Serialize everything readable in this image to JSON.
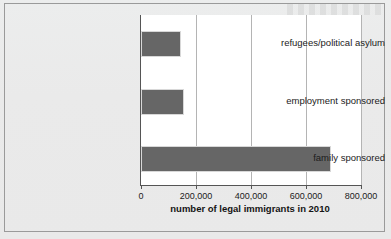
{
  "figure": {
    "background_color": "#eaeaea",
    "plot_background_color": "#ffffff",
    "frame_border_color": "#9a9a9a"
  },
  "chart_data": {
    "type": "bar",
    "orientation": "horizontal",
    "title": "",
    "subtitle": "",
    "xlabel": "number of legal immigrants in 2010",
    "ylabel": "",
    "categories": [
      "family sponsored",
      "employment sponsored",
      "refugees/political asylum"
    ],
    "values": [
      690000,
      155000,
      145000
    ],
    "series": [
      {
        "name": "number of legal immigrants in 2010",
        "values": [
          690000,
          155000,
          145000
        ],
        "color": "#666666"
      }
    ],
    "xlim": [
      0,
      800000
    ],
    "xticks": [
      0,
      200000,
      400000,
      600000,
      800000
    ],
    "xtick_labels": [
      "0",
      "200,000",
      "400,000",
      "600,000",
      "800,000"
    ],
    "grid": {
      "vertical": true,
      "horizontal": false,
      "color": "#b4b4b4"
    },
    "legend": {
      "visible": false,
      "position": "none"
    },
    "bar_color": "#666666",
    "bar_edge_color": "#d8d8d8",
    "axis_color": "#555555"
  }
}
